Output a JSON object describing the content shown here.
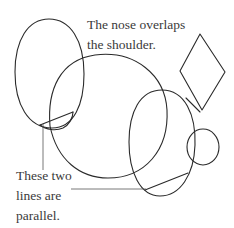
{
  "annotations": {
    "nose_overlap": {
      "lines": [
        "The nose overlaps",
        "the shoulder."
      ]
    },
    "parallel_lines": {
      "lines": [
        "These two",
        "lines are",
        "parallel."
      ]
    }
  },
  "colors": {
    "stroke": "#2a2a2a",
    "text": "#3a3a3a",
    "background": "#ffffff"
  },
  "shapes": {
    "left_ellipse": {
      "cx": 49,
      "cy": 73,
      "rx": 34,
      "ry": 54
    },
    "large_circle": {
      "cx": 108,
      "cy": 118,
      "rx": 58,
      "ry": 60
    },
    "right_ellipse": {
      "cx": 162,
      "cy": 142,
      "rx": 34,
      "ry": 52
    },
    "small_circle": {
      "cx": 202,
      "cy": 147,
      "r": 16
    },
    "diamond": {
      "points": "200,34 180,71 202,110 225,72"
    },
    "parallel_line_left": {
      "x1": 40,
      "y1": 125,
      "x2": 73,
      "y2": 112
    },
    "parallel_line_right": {
      "x1": 145,
      "y1": 190,
      "x2": 188,
      "y2": 173
    }
  }
}
